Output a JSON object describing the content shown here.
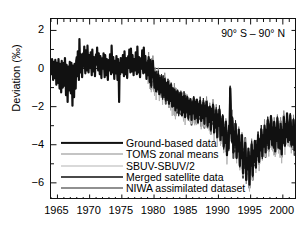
{
  "figure": {
    "annotation": "90° S – 90° N",
    "ylabel": "Deviation (‰)"
  },
  "axes": {
    "y_ticks": [
      "2",
      "0",
      "−2",
      "−4",
      "−6"
    ],
    "x_ticks": [
      "1965",
      "1970",
      "1975",
      "1980",
      "1985",
      "1990",
      "1995",
      "2000"
    ]
  },
  "legend": {
    "items": [
      {
        "label": "Ground-based data",
        "color": "#111111",
        "width": 2.2
      },
      {
        "label": "TOMS zonal means",
        "color": "#8a8a8a",
        "width": 1.0
      },
      {
        "label": "SBUV-SBUV/2",
        "color": "#b4b4b4",
        "width": 1.0
      },
      {
        "label": "Merged satellite data",
        "color": "#4a4a4a",
        "width": 2.0
      },
      {
        "label": "NIWA assimilated dataset",
        "color": "#222222",
        "width": 1.0
      }
    ]
  },
  "chart_data": {
    "type": "line",
    "title": "",
    "subtitle": "",
    "xlabel": "",
    "ylabel": "Deviation (‰)",
    "annotation": "90° S – 90° N",
    "xlim": [
      1964.0,
      2002.2
    ],
    "ylim": [
      -6.9,
      2.6
    ],
    "grid": false,
    "legend_position": "lower-left",
    "zero_line": 0,
    "x_major_step": 5,
    "x_minor_step": 1,
    "y_major_step": 2,
    "y_minor_step": 1,
    "series": [
      {
        "name": "Ground-based data",
        "color": "#111111",
        "width": 2.2,
        "x_start": 1964.0,
        "x_step": 0.0833,
        "values": [
          0.2,
          -0.3,
          0.5,
          0.1,
          -0.6,
          0.35,
          0.0,
          -0.5,
          0.45,
          0.1,
          -0.85,
          0.3,
          0.15,
          -0.75,
          0.5,
          -0.2,
          -1.05,
          0.25,
          -0.1,
          -1.25,
          0.4,
          -0.35,
          -1.0,
          0.2,
          0.3,
          -0.9,
          0.55,
          -0.15,
          -1.4,
          0.2,
          -0.6,
          -1.75,
          0.1,
          -0.5,
          -1.15,
          0.35,
          -0.1,
          -1.3,
          0.3,
          -0.55,
          -1.95,
          0.15,
          -0.7,
          -1.5,
          0.25,
          -0.2,
          -1.05,
          0.4,
          0.6,
          -0.4,
          0.9,
          0.2,
          -0.6,
          1.55,
          0.4,
          -0.2,
          0.75,
          0.25,
          -0.45,
          0.6,
          0.8,
          0.1,
          1.15,
          0.3,
          -0.25,
          0.95,
          0.35,
          -0.1,
          1.2,
          0.45,
          -0.2,
          0.7,
          0.5,
          0.05,
          0.85,
          0.2,
          -0.35,
          1.0,
          0.3,
          -0.15,
          0.6,
          0.15,
          -0.4,
          0.5,
          0.75,
          0.2,
          1.1,
          0.35,
          -0.1,
          0.8,
          0.25,
          -0.3,
          0.65,
          0.1,
          -0.5,
          0.45,
          0.55,
          0.0,
          0.8,
          0.15,
          -0.45,
          0.7,
          0.2,
          -0.35,
          0.5,
          0.05,
          -0.6,
          0.35,
          0.45,
          -0.1,
          0.75,
          0.2,
          -0.3,
          1.2,
          0.35,
          -0.2,
          0.6,
          0.1,
          -0.55,
          0.4,
          0.3,
          -0.25,
          0.65,
          0.1,
          -0.6,
          0.5,
          0.05,
          -1.75,
          0.3,
          -0.3,
          0.55,
          0.1,
          0.35,
          -0.2,
          0.7,
          0.15,
          -0.4,
          0.9,
          0.25,
          -0.3,
          0.55,
          0.0,
          -0.5,
          0.35,
          0.65,
          0.05,
          1.0,
          0.3,
          -0.2,
          1.05,
          0.35,
          -0.15,
          0.7,
          0.2,
          -0.35,
          0.5,
          0.4,
          -0.1,
          0.85,
          0.2,
          -0.3,
          1.15,
          0.3,
          -0.2,
          0.6,
          0.1,
          -0.45,
          0.4,
          0.55,
          0.0,
          0.95,
          0.25,
          -0.25,
          1.1,
          0.3,
          -0.2,
          0.65,
          0.05,
          -0.55,
          0.3,
          0.2,
          -0.35,
          0.6,
          0.0,
          -0.7,
          0.45,
          -0.1,
          -0.9,
          0.25,
          -0.45,
          0.4,
          -0.2,
          -0.55,
          -1.0,
          -0.2,
          -0.75,
          -1.2,
          -0.35,
          -0.6,
          -1.1,
          -0.3,
          -0.8,
          -1.35,
          -0.5,
          -0.7,
          -1.25,
          -0.45,
          -0.9,
          -1.5,
          -0.6,
          -0.85,
          -1.4,
          -0.55,
          -1.0,
          -1.65,
          -0.75,
          -0.95,
          -1.55,
          -0.7,
          -1.1,
          -1.85,
          -0.9,
          -1.2,
          -1.7,
          -0.85,
          -1.3,
          -2.0,
          -1.05,
          -1.35,
          -1.95,
          -1.1,
          -1.5,
          -2.2,
          -1.25,
          -1.45,
          -2.05,
          -1.2,
          -1.6,
          -2.35,
          -1.4,
          -1.55,
          -2.15,
          -1.3,
          -1.7,
          -2.45,
          -1.5,
          -1.65,
          -2.3,
          -1.45,
          -1.8,
          -2.55,
          -1.6,
          -1.7,
          -2.25,
          -1.5,
          -1.85,
          -2.6,
          -1.7,
          -1.8,
          -2.4,
          -1.6,
          -1.95,
          -2.7,
          -1.8,
          -1.85,
          -2.35,
          -1.55,
          -1.9,
          -2.65,
          -1.75,
          -1.85,
          -2.5,
          -1.65,
          -2.0,
          -2.8,
          -1.9,
          -1.9,
          -2.45,
          -1.7,
          -2.05,
          -2.75,
          -1.95,
          -2.0,
          -2.6,
          -1.8,
          -2.15,
          -2.9,
          -2.05,
          -1.95,
          -2.5,
          -1.75,
          -2.1,
          -3.0,
          -2.1,
          -2.2,
          -2.8,
          -2.0,
          -2.35,
          -3.2,
          -2.3,
          -2.1,
          -2.7,
          -1.9,
          -2.25,
          -3.35,
          -2.4,
          -2.5,
          -3.1,
          -2.2,
          -2.6,
          -3.6,
          -2.6,
          -2.4,
          -3.0,
          -2.15,
          -2.55,
          -3.75,
          -2.8,
          -2.9,
          -3.5,
          -2.5,
          -3.0,
          -4.1,
          -3.2,
          -3.1,
          -3.9,
          -2.8,
          -3.3,
          -4.55,
          -3.6,
          -3.5,
          -4.2,
          -3.0,
          -3.4,
          -1.05,
          -2.2,
          -3.0,
          -3.8,
          -2.6,
          -3.1,
          -4.4,
          -3.4,
          -3.3,
          -4.0,
          -2.9,
          -3.5,
          -4.7,
          -3.7,
          -3.6,
          -4.35,
          -3.2,
          -3.8,
          -5.1,
          -4.1,
          -4.0,
          -4.7,
          -3.5,
          -4.2,
          -5.5,
          -4.5,
          -4.4,
          -5.0,
          -3.9,
          -4.5,
          -5.85,
          -4.9,
          -4.7,
          -5.3,
          -4.2,
          -4.8,
          -6.1,
          -5.2,
          -4.6,
          -5.1,
          -4.0,
          -4.5,
          -5.6,
          -4.6,
          -4.3,
          -4.9,
          -3.8,
          -4.2,
          -5.2,
          -4.3,
          -4.0,
          -4.6,
          -3.5,
          -3.9,
          -4.9,
          -4.0,
          -3.7,
          -4.3,
          -3.2,
          -3.6,
          -4.6,
          -3.7,
          -3.5,
          -4.1,
          -3.0,
          -3.4,
          -4.4,
          -3.5,
          -3.2,
          -3.9,
          -2.7,
          -3.1,
          -4.2,
          -3.3,
          -3.0,
          -3.7,
          -2.5,
          -2.9,
          -4.0,
          -3.1,
          -3.3,
          -4.1,
          -2.8,
          -3.2,
          -4.35,
          -3.4,
          -3.1,
          -3.8,
          -2.6,
          -3.0,
          -4.15,
          -3.2,
          -3.4,
          -4.2,
          -2.9,
          -3.3,
          -4.5,
          -3.5,
          -3.2,
          -3.9,
          -2.55,
          -2.95,
          -4.05,
          -3.1,
          -2.9,
          -3.6,
          -2.35,
          -2.75,
          -3.85,
          -2.95,
          -3.0,
          -3.75,
          -2.45,
          -2.85,
          -4.0,
          -3.05,
          -3.2,
          -4.0,
          -2.7,
          -3.1,
          -4.3,
          -3.3,
          -3.0,
          -3.7,
          -2.4,
          -2.8,
          -4.1,
          -3.15,
          -3.35,
          -4.15,
          -2.85,
          -3.25,
          -4.45,
          -3.45
        ]
      },
      {
        "name": "Merged satellite data",
        "color": "#4a4a4a",
        "width": 2.0,
        "x_start": 1979.0,
        "x_step": 0.0833,
        "offset": -0.08,
        "note": "tracks ground-based closely from 1979 onward"
      },
      {
        "name": "TOMS zonal means",
        "color": "#8a8a8a",
        "width": 1.0,
        "x_start": 1979.0,
        "x_step": 0.0833,
        "offset": 0.14,
        "note": "light grey trace shadowing main curve"
      },
      {
        "name": "SBUV-SBUV/2",
        "color": "#b4b4b4",
        "width": 1.0,
        "x_start": 1979.0,
        "x_step": 0.0833,
        "offset": -0.3,
        "note": "palest trace, excursions to -6.5 near 1993"
      },
      {
        "name": "NIWA assimilated dataset",
        "color": "#222222",
        "width": 1.0,
        "x_start": 1979.0,
        "x_step": 0.0833,
        "offset": 0.05,
        "note": "thin dark trace overlaying main curve"
      }
    ],
    "summary": {
      "1964_1979_mean": 0.1,
      "1964_1979_range": [
        -2.0,
        1.6
      ],
      "1980_1990_trend": "steady decline from ~0 to ~ -3",
      "1991_1994_minimum": -6.2,
      "1995_2002_mean": -3.4,
      "overall": "Global total ozone deviation declines from ~0%‰ in the 1960s-70s to about -3 to -4%‰ by the late 1990s with a deep minimum near 1993."
    }
  }
}
